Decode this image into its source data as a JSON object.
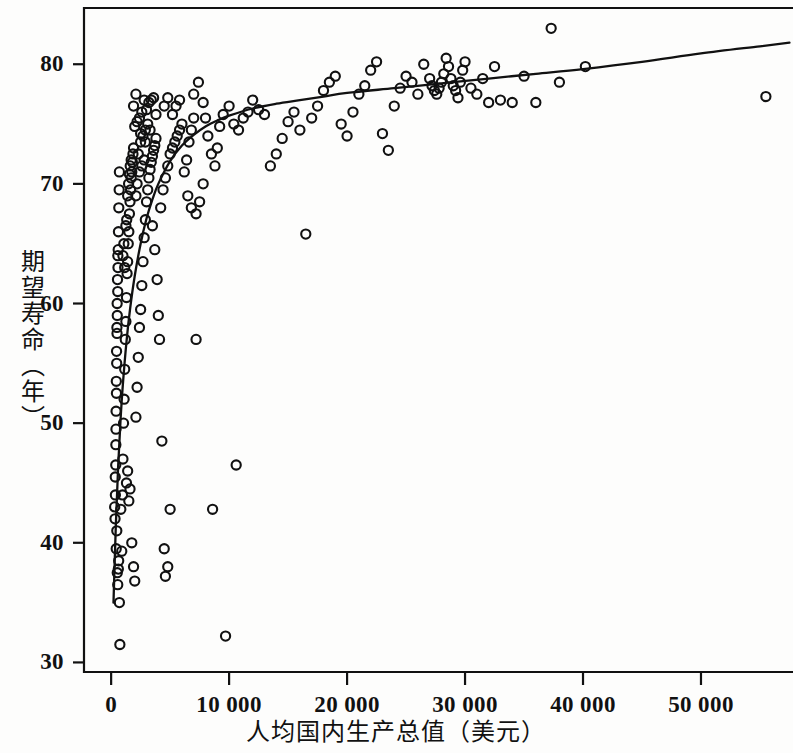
{
  "chart_data": {
    "type": "scatter",
    "title": "",
    "xlabel": "人均国内生产总值（美元）",
    "ylabel": "期望寿命（年）",
    "xlim": [
      -2300,
      57800
    ],
    "ylim": [
      29.2,
      84.7
    ],
    "xticks": [
      0,
      10000,
      20000,
      30000,
      40000,
      50000
    ],
    "xticklabels": [
      "0",
      "10 000",
      "20 000",
      "30 000",
      "40 000",
      "50 000"
    ],
    "yticks": [
      30,
      40,
      50,
      60,
      70,
      80
    ],
    "yticklabels": [
      "30",
      "40",
      "50",
      "60",
      "70",
      "80"
    ],
    "grid": false,
    "legend": null,
    "marker": "open-circle",
    "marker_color": "#111111",
    "series": [
      {
        "name": "国家",
        "points": [
          [
            300,
            43.0
          ],
          [
            350,
            45.5
          ],
          [
            400,
            48.2
          ],
          [
            420,
            51.0
          ],
          [
            450,
            52.5
          ],
          [
            470,
            55.0
          ],
          [
            500,
            57.5
          ],
          [
            520,
            59.0
          ],
          [
            560,
            61.0
          ],
          [
            580,
            63.0
          ],
          [
            600,
            64.5
          ],
          [
            620,
            66.0
          ],
          [
            650,
            68.0
          ],
          [
            680,
            69.5
          ],
          [
            700,
            71.0
          ],
          [
            330,
            42.0
          ],
          [
            360,
            44.0
          ],
          [
            390,
            46.5
          ],
          [
            410,
            49.5
          ],
          [
            440,
            53.5
          ],
          [
            460,
            56.0
          ],
          [
            490,
            58.0
          ],
          [
            510,
            60.0
          ],
          [
            540,
            62.0
          ],
          [
            570,
            64.0
          ],
          [
            480,
            41.0
          ],
          [
            430,
            39.5
          ],
          [
            520,
            37.5
          ],
          [
            560,
            36.5
          ],
          [
            610,
            37.8
          ],
          [
            640,
            38.5
          ],
          [
            700,
            35.0
          ],
          [
            740,
            31.5
          ],
          [
            820,
            42.8
          ],
          [
            900,
            39.3
          ],
          [
            960,
            44.0
          ],
          [
            1000,
            47.0
          ],
          [
            1050,
            50.0
          ],
          [
            1100,
            52.0
          ],
          [
            1150,
            54.5
          ],
          [
            1200,
            57.0
          ],
          [
            1250,
            58.5
          ],
          [
            1300,
            60.5
          ],
          [
            1350,
            62.5
          ],
          [
            1400,
            63.5
          ],
          [
            1450,
            65.0
          ],
          [
            1500,
            66.0
          ],
          [
            1550,
            67.5
          ],
          [
            1600,
            68.5
          ],
          [
            1650,
            69.5
          ],
          [
            1700,
            70.5
          ],
          [
            1750,
            71.0
          ],
          [
            1800,
            71.8
          ],
          [
            1850,
            72.5
          ],
          [
            1900,
            73.0
          ],
          [
            1000,
            64.0
          ],
          [
            1080,
            65.0
          ],
          [
            1150,
            63.0
          ],
          [
            1250,
            66.5
          ],
          [
            1320,
            67.0
          ],
          [
            1400,
            69.0
          ],
          [
            1480,
            70.0
          ],
          [
            1550,
            70.8
          ],
          [
            1620,
            71.5
          ],
          [
            1700,
            72.0
          ],
          [
            1300,
            45.0
          ],
          [
            1400,
            46.0
          ],
          [
            1500,
            43.5
          ],
          [
            1600,
            44.5
          ],
          [
            1750,
            40.0
          ],
          [
            1900,
            38.0
          ],
          [
            2000,
            36.8
          ],
          [
            2100,
            50.5
          ],
          [
            2200,
            53.0
          ],
          [
            2300,
            55.5
          ],
          [
            2400,
            58.0
          ],
          [
            2500,
            59.5
          ],
          [
            2600,
            61.5
          ],
          [
            2700,
            63.5
          ],
          [
            2800,
            65.5
          ],
          [
            2900,
            67.0
          ],
          [
            3000,
            68.5
          ],
          [
            3100,
            69.5
          ],
          [
            3200,
            70.5
          ],
          [
            3300,
            71.2
          ],
          [
            3400,
            71.8
          ],
          [
            3500,
            72.3
          ],
          [
            3600,
            72.8
          ],
          [
            3700,
            73.2
          ],
          [
            3800,
            73.8
          ],
          [
            2300,
            72.5
          ],
          [
            2500,
            73.5
          ],
          [
            2700,
            74.0
          ],
          [
            2900,
            74.5
          ],
          [
            3100,
            75.0
          ],
          [
            2100,
            69.0
          ],
          [
            2200,
            70.0
          ],
          [
            2400,
            71.0
          ],
          [
            2600,
            71.5
          ],
          [
            2800,
            72.0
          ],
          [
            1900,
            76.5
          ],
          [
            2100,
            77.5
          ],
          [
            2400,
            75.5
          ],
          [
            2600,
            76.0
          ],
          [
            2800,
            77.0
          ],
          [
            3000,
            76.2
          ],
          [
            3200,
            76.8
          ],
          [
            3400,
            77.0
          ],
          [
            3600,
            77.2
          ],
          [
            3800,
            75.8
          ],
          [
            2000,
            74.8
          ],
          [
            2200,
            75.2
          ],
          [
            2500,
            74.2
          ],
          [
            2900,
            73.5
          ],
          [
            3300,
            74.5
          ],
          [
            3500,
            66.5
          ],
          [
            3700,
            64.5
          ],
          [
            3900,
            62.0
          ],
          [
            4000,
            59.0
          ],
          [
            4100,
            57.0
          ],
          [
            4300,
            48.5
          ],
          [
            4500,
            39.5
          ],
          [
            4600,
            37.2
          ],
          [
            4800,
            38.0
          ],
          [
            5000,
            42.8
          ],
          [
            4200,
            68.0
          ],
          [
            4400,
            69.5
          ],
          [
            4600,
            70.5
          ],
          [
            4800,
            71.5
          ],
          [
            5000,
            72.5
          ],
          [
            5200,
            73.0
          ],
          [
            5400,
            73.5
          ],
          [
            5600,
            74.0
          ],
          [
            5800,
            74.5
          ],
          [
            6000,
            75.0
          ],
          [
            4500,
            76.5
          ],
          [
            4800,
            77.2
          ],
          [
            5200,
            75.8
          ],
          [
            5500,
            76.5
          ],
          [
            5800,
            77.0
          ],
          [
            6200,
            71.0
          ],
          [
            6400,
            72.0
          ],
          [
            6600,
            73.5
          ],
          [
            6800,
            74.5
          ],
          [
            7000,
            75.5
          ],
          [
            6500,
            69.0
          ],
          [
            6800,
            68.0
          ],
          [
            7200,
            67.5
          ],
          [
            7500,
            68.5
          ],
          [
            7800,
            70.0
          ],
          [
            7000,
            77.5
          ],
          [
            7400,
            78.5
          ],
          [
            7800,
            76.8
          ],
          [
            8000,
            75.5
          ],
          [
            8200,
            74.0
          ],
          [
            8500,
            72.5
          ],
          [
            8800,
            71.5
          ],
          [
            9000,
            73.0
          ],
          [
            9200,
            74.8
          ],
          [
            9500,
            75.8
          ],
          [
            7200,
            57.0
          ],
          [
            8600,
            42.8
          ],
          [
            10600,
            46.5
          ],
          [
            9700,
            32.2
          ],
          [
            10000,
            76.5
          ],
          [
            10400,
            75.0
          ],
          [
            10800,
            74.5
          ],
          [
            11200,
            75.5
          ],
          [
            11600,
            76.0
          ],
          [
            12000,
            77.0
          ],
          [
            12500,
            76.2
          ],
          [
            13000,
            75.8
          ],
          [
            13500,
            71.5
          ],
          [
            14000,
            72.5
          ],
          [
            14500,
            73.8
          ],
          [
            15000,
            75.2
          ],
          [
            15500,
            76.0
          ],
          [
            16000,
            74.5
          ],
          [
            16500,
            65.8
          ],
          [
            17000,
            75.5
          ],
          [
            17500,
            76.5
          ],
          [
            18000,
            77.8
          ],
          [
            18500,
            78.5
          ],
          [
            19000,
            79.0
          ],
          [
            19500,
            75.0
          ],
          [
            20000,
            74.0
          ],
          [
            20500,
            76.0
          ],
          [
            21000,
            77.5
          ],
          [
            21500,
            78.2
          ],
          [
            22000,
            79.5
          ],
          [
            22500,
            80.2
          ],
          [
            23000,
            74.2
          ],
          [
            23500,
            72.8
          ],
          [
            24000,
            76.5
          ],
          [
            24500,
            78.0
          ],
          [
            25000,
            79.0
          ],
          [
            25500,
            78.5
          ],
          [
            26000,
            77.5
          ],
          [
            26500,
            80.0
          ],
          [
            27000,
            78.8
          ],
          [
            27200,
            78.2
          ],
          [
            27400,
            77.8
          ],
          [
            27600,
            77.5
          ],
          [
            27800,
            78.0
          ],
          [
            28000,
            78.5
          ],
          [
            28200,
            79.2
          ],
          [
            28400,
            80.5
          ],
          [
            28600,
            79.8
          ],
          [
            28800,
            78.8
          ],
          [
            29000,
            78.2
          ],
          [
            29200,
            77.8
          ],
          [
            29400,
            77.2
          ],
          [
            29600,
            78.5
          ],
          [
            29800,
            79.5
          ],
          [
            30000,
            80.2
          ],
          [
            30500,
            78.0
          ],
          [
            31000,
            77.5
          ],
          [
            31500,
            78.8
          ],
          [
            32000,
            76.8
          ],
          [
            32500,
            79.8
          ],
          [
            33000,
            77.0
          ],
          [
            34000,
            76.8
          ],
          [
            35000,
            79.0
          ],
          [
            36000,
            76.8
          ],
          [
            37300,
            83.0
          ],
          [
            38000,
            78.5
          ],
          [
            40200,
            79.8
          ],
          [
            55500,
            77.3
          ]
        ]
      }
    ],
    "fit_curve": {
      "name": "对数拟合曲线",
      "description": "logarithmic smoothing fit of life expectancy vs GDP per capita",
      "points": [
        [
          200,
          35.0
        ],
        [
          400,
          41.5
        ],
        [
          600,
          46.5
        ],
        [
          800,
          50.3
        ],
        [
          1000,
          53.3
        ],
        [
          1300,
          56.8
        ],
        [
          1600,
          59.5
        ],
        [
          2000,
          62.3
        ],
        [
          2500,
          65.0
        ],
        [
          3000,
          67.1
        ],
        [
          3500,
          68.7
        ],
        [
          4000,
          70.0
        ],
        [
          5000,
          71.9
        ],
        [
          6000,
          73.2
        ],
        [
          7000,
          74.1
        ],
        [
          8000,
          74.8
        ],
        [
          9000,
          75.3
        ],
        [
          10000,
          75.7
        ],
        [
          12000,
          76.3
        ],
        [
          14000,
          76.7
        ],
        [
          16000,
          77.0
        ],
        [
          18000,
          77.3
        ],
        [
          20000,
          77.6
        ],
        [
          24000,
          78.0
        ],
        [
          28000,
          78.4
        ],
        [
          32000,
          78.8
        ],
        [
          36000,
          79.2
        ],
        [
          40000,
          79.6
        ],
        [
          45000,
          80.2
        ],
        [
          50000,
          80.9
        ],
        [
          55000,
          81.5
        ],
        [
          57500,
          81.8
        ]
      ]
    }
  },
  "axes": {
    "x_title": "人均国内生产总值（美元）",
    "y_title": "期望寿命（年）"
  }
}
